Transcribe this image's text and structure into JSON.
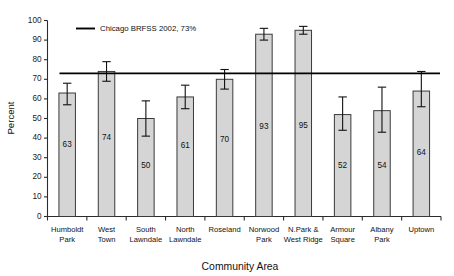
{
  "chart_data": {
    "type": "bar",
    "title": "",
    "xlabel": "Community Area",
    "ylabel": "Percent",
    "ylim": [
      0,
      100
    ],
    "yticks": [
      0,
      10,
      20,
      30,
      40,
      50,
      60,
      70,
      80,
      90,
      100
    ],
    "ytick_labels": [
      "0",
      "10",
      "20",
      "30",
      "40",
      "50",
      "60",
      "70",
      "80",
      "90",
      "100"
    ],
    "grid": false,
    "legend_position": "top-left-inside",
    "categories": [
      "Humboldt Park",
      "West Town",
      "South Lawndale",
      "North Lawndale",
      "Roseland",
      "Norwood Park",
      "N.Park & West Ridge",
      "Armour Square",
      "Albany Park",
      "Uptown"
    ],
    "category_lines": [
      [
        "Humboldt",
        "Park"
      ],
      [
        "West",
        "Town"
      ],
      [
        "South",
        "Lawndale"
      ],
      [
        "North",
        "Lawndale"
      ],
      [
        "Roseland",
        ""
      ],
      [
        "Norwood",
        "Park"
      ],
      [
        "N.Park &",
        "West Ridge"
      ],
      [
        "Armour",
        "Square"
      ],
      [
        "Albany",
        "Park"
      ],
      [
        "Uptown",
        ""
      ]
    ],
    "values": [
      63,
      74,
      50,
      61,
      70,
      93,
      95,
      52,
      54,
      64
    ],
    "value_labels": [
      "63",
      "74",
      "50",
      "61",
      "70",
      "93",
      "95",
      "52",
      "54",
      "64"
    ],
    "error_low": [
      57,
      69,
      41,
      55,
      65,
      90,
      93,
      44,
      43,
      56
    ],
    "error_high": [
      68,
      79,
      59,
      67,
      75,
      96,
      97,
      61,
      66,
      74
    ],
    "reference_line": {
      "value": 73,
      "label": "Chicago BRFSS 2002, 73%"
    },
    "series": [
      {
        "name": "Community Area Percent",
        "values": [
          63,
          74,
          50,
          61,
          70,
          93,
          95,
          52,
          54,
          64
        ]
      }
    ],
    "colors": {
      "bar_fill": "#d5d5d5",
      "bar_stroke": "#3a3a3a",
      "reference_line": "#000000",
      "error_bar": "#111111",
      "axis": "#2b2b2b",
      "text": "#111111",
      "background": "#ffffff"
    }
  },
  "legend": {
    "entries": [
      {
        "label": "Chicago BRFSS 2002, 73%",
        "marker": "line",
        "color": "#000000"
      }
    ]
  },
  "axes": {
    "y_title": "Percent",
    "x_title": "Community Area"
  }
}
